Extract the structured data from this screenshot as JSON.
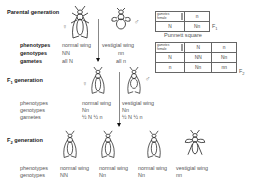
{
  "parental": {
    "title": "Parental generation",
    "female_symbol": "♀",
    "male_symbol": "♂",
    "labels": {
      "phenotypes": "phenotypes",
      "genotypes": "genotypes",
      "gametes": "gametes"
    },
    "female": {
      "phenotype": "normal wing",
      "genotype": "NN",
      "gametes": "all N"
    },
    "male": {
      "phenotype": "vestigial wing",
      "genotype": "nn",
      "gametes": "all n"
    }
  },
  "f1": {
    "title": "F",
    "title_sub": "1",
    "title_rest": " generation",
    "female_symbol": "♀",
    "male_symbol": "♂",
    "labels": {
      "phenotypes": "phenotypes",
      "genotypes": "genotypes",
      "gametes": "gametes"
    },
    "female": {
      "phenotype": "normal wing",
      "genotype": "Nn",
      "gametes": "½ N  ½ n"
    },
    "male": {
      "phenotype": "vestigial wing",
      "genotype": "Nn",
      "gametes": "½ N  ½ n"
    }
  },
  "f2": {
    "title": "F",
    "title_sub": "2",
    "title_rest": " generation",
    "labels": {
      "phenotypes": "phenotypes",
      "genotypes": "genotypes"
    },
    "offspring": [
      {
        "phenotype": "normal wing",
        "genotype": "NN"
      },
      {
        "phenotype": "normal wing",
        "genotype": "Nn"
      },
      {
        "phenotype": "normal wing",
        "genotype": "Nn"
      },
      {
        "phenotype": "vestigial wing",
        "genotype": "nn"
      }
    ]
  },
  "punnett_f1": {
    "corner_top": "gametes",
    "corner_bottom": "female",
    "col_headers": [
      "n"
    ],
    "rows": [
      {
        "header": "N",
        "cells": [
          "Nn"
        ]
      }
    ],
    "label": "F",
    "label_sub": "1"
  },
  "punnett_caption": "Punnett square",
  "punnett_f2": {
    "corner_top": "gametes",
    "corner_bottom": "female",
    "col_headers": [
      "N",
      "n"
    ],
    "rows": [
      {
        "header": "N",
        "cells": [
          "NN",
          "Nn"
        ]
      },
      {
        "header": "n",
        "cells": [
          "Nn",
          "nn"
        ]
      }
    ],
    "label": "F",
    "label_sub": "2"
  }
}
